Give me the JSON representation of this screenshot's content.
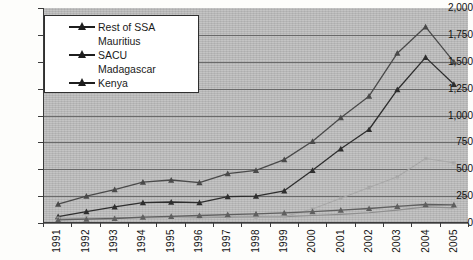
{
  "chart_data": {
    "type": "line",
    "title": "",
    "xlabel": "",
    "ylabel": "",
    "grid": true,
    "legend_position": "top-left",
    "ylim": [
      0,
      2000
    ],
    "ytick_labels": [
      "2,000",
      "1,750",
      "1,500",
      "1,250",
      "1,000",
      "750",
      "500",
      "250",
      "0"
    ],
    "ytick_values": [
      2000,
      1750,
      1500,
      1250,
      1000,
      750,
      500,
      250,
      0
    ],
    "categories": [
      "1991",
      "1992",
      "1993",
      "1994",
      "1995",
      "1996",
      "1997",
      "1998",
      "1999",
      "2000",
      "2001",
      "2002",
      "2003",
      "2004",
      "2005"
    ],
    "series": [
      {
        "name": "Rest of SSA",
        "color": "#4a4a4a",
        "marker": "triangle",
        "values": [
          175,
          250,
          310,
          380,
          400,
          375,
          460,
          490,
          590,
          760,
          980,
          1180,
          1580,
          1825,
          1500
        ]
      },
      {
        "name": "Mauritius",
        "color": "#8e8e8e",
        "marker": "none",
        "values": [
          40,
          45,
          48,
          50,
          52,
          50,
          55,
          58,
          60,
          70,
          80,
          95,
          120,
          150,
          140
        ]
      },
      {
        "name": "SACU",
        "color": "#2e2e2e",
        "marker": "triangle",
        "values": [
          60,
          105,
          150,
          190,
          195,
          190,
          245,
          250,
          300,
          490,
          690,
          870,
          1240,
          1540,
          1290
        ]
      },
      {
        "name": "Madagascar",
        "color": "#a8a8a8",
        "marker": "dot",
        "values": [
          45,
          48,
          45,
          50,
          52,
          55,
          58,
          55,
          60,
          130,
          230,
          330,
          430,
          600,
          560
        ]
      },
      {
        "name": "Kenya",
        "color": "#5f5f5f",
        "marker": "triangle",
        "values": [
          30,
          35,
          42,
          55,
          62,
          70,
          78,
          85,
          95,
          105,
          120,
          135,
          155,
          172,
          168
        ]
      }
    ]
  },
  "legend": {
    "items": [
      {
        "label": "Rest of SSA",
        "show_marker": true
      },
      {
        "label": "Mauritius",
        "show_marker": false
      },
      {
        "label": "SACU",
        "show_marker": true
      },
      {
        "label": "Madagascar",
        "show_marker": false
      },
      {
        "label": "Kenya",
        "show_marker": true
      }
    ]
  },
  "colors": {
    "plot_background": "#bdbdbd",
    "page_background": "#fdfdfb",
    "gridline": "#5c5c5c",
    "axis": "#3b3b3b",
    "legend_background": "#ffffff"
  }
}
